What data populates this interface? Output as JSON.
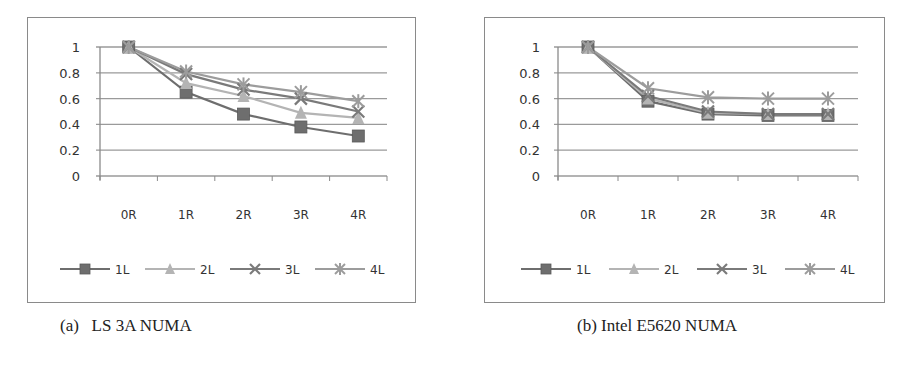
{
  "figure": {
    "caption_a": "(a)   LS 3A NUMA",
    "caption_b": "(b) Intel E5620 NUMA",
    "figure_caption_partial": ""
  },
  "chart_data": [
    {
      "type": "line",
      "title": "LS 3A NUMA",
      "categories": [
        "0R",
        "1R",
        "2R",
        "3R",
        "4R"
      ],
      "series": [
        {
          "name": "1L",
          "marker": "square",
          "color": "#6e6e6e",
          "values": [
            1.0,
            0.65,
            0.48,
            0.38,
            0.31
          ]
        },
        {
          "name": "2L",
          "marker": "triangle",
          "color": "#b4b4b4",
          "values": [
            1.0,
            0.72,
            0.62,
            0.49,
            0.45
          ]
        },
        {
          "name": "3L",
          "marker": "x",
          "color": "#7a7a7a",
          "values": [
            1.0,
            0.79,
            0.67,
            0.6,
            0.5
          ]
        },
        {
          "name": "4L",
          "marker": "star",
          "color": "#9c9c9c",
          "values": [
            1.0,
            0.81,
            0.71,
            0.65,
            0.58
          ]
        }
      ],
      "yticks": [
        "0",
        "0.2",
        "0.4",
        "0.6",
        "0.8",
        "1"
      ],
      "ylim": [
        0,
        1
      ],
      "xlabel": "",
      "ylabel": "",
      "grid": true,
      "legend_position": "bottom"
    },
    {
      "type": "line",
      "title": "Intel E5620 NUMA",
      "categories": [
        "0R",
        "1R",
        "2R",
        "3R",
        "4R"
      ],
      "series": [
        {
          "name": "1L",
          "marker": "square",
          "color": "#6e6e6e",
          "values": [
            1.0,
            0.58,
            0.48,
            0.47,
            0.47
          ]
        },
        {
          "name": "2L",
          "marker": "triangle",
          "color": "#b4b4b4",
          "values": [
            1.0,
            0.6,
            0.49,
            0.48,
            0.48
          ]
        },
        {
          "name": "3L",
          "marker": "x",
          "color": "#7a7a7a",
          "values": [
            1.0,
            0.62,
            0.5,
            0.48,
            0.48
          ]
        },
        {
          "name": "4L",
          "marker": "star",
          "color": "#9c9c9c",
          "values": [
            1.0,
            0.68,
            0.61,
            0.6,
            0.6
          ]
        }
      ],
      "yticks": [
        "0",
        "0.2",
        "0.4",
        "0.6",
        "0.8",
        "1"
      ],
      "ylim": [
        0,
        1
      ],
      "xlabel": "",
      "ylabel": "",
      "grid": true,
      "legend_position": "bottom"
    }
  ]
}
